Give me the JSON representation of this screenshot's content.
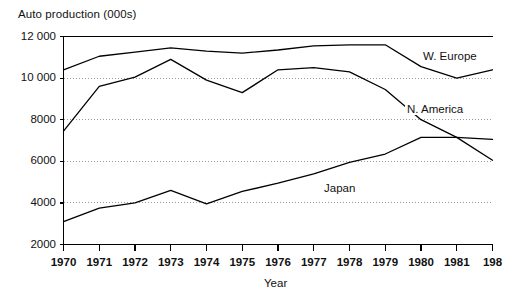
{
  "chart_data": {
    "type": "line",
    "title": "Auto production (000s)",
    "xlabel": "Year",
    "ylabel": "",
    "x": [
      1970,
      1971,
      1972,
      1973,
      1974,
      1975,
      1976,
      1977,
      1978,
      1979,
      1980,
      1981,
      1982
    ],
    "xtick_labels": [
      "1970",
      "1971",
      "1972",
      "1973",
      "1974",
      "1975",
      "1976",
      "1977",
      "1978",
      "1979",
      "1980",
      "1981",
      "198"
    ],
    "ytick_labels": [
      "2000",
      "4000",
      "6000",
      "8000",
      "10 000",
      "12 000"
    ],
    "yticks": [
      2000,
      4000,
      6000,
      8000,
      10000,
      12000
    ],
    "xlim": [
      1970,
      1982
    ],
    "ylim": [
      2000,
      12000
    ],
    "grid": "horizontal-dotted",
    "legend": "inline-labels",
    "series": [
      {
        "name": "W. Europe",
        "label_x": 421,
        "label_y": 50,
        "values": [
          10400,
          11050,
          11250,
          11450,
          11300,
          11200,
          11350,
          11550,
          11600,
          11600,
          10550,
          10000,
          10400
        ]
      },
      {
        "name": "N. America",
        "label_x": 405,
        "label_y": 103,
        "values": [
          7450,
          9600,
          10050,
          10900,
          9900,
          9300,
          10400,
          10500,
          10300,
          9450,
          8000,
          7150,
          6050
        ]
      },
      {
        "name": "Japan",
        "label_x": 322,
        "label_y": 182,
        "values": [
          3100,
          3750,
          4000,
          4600,
          3950,
          4550,
          4950,
          5400,
          5950,
          6350,
          7150,
          7150,
          7050
        ]
      }
    ]
  },
  "axes": {
    "x_axis_title": "Year"
  }
}
